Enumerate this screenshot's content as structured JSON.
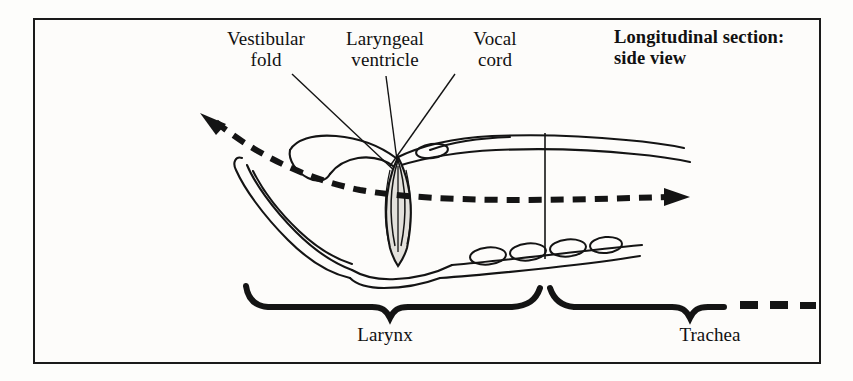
{
  "figure": {
    "title": "Longitudinal section:\nside view",
    "background_color": "#fdfcfa",
    "frame_color": "#1a1a1a",
    "ink_color": "#141414",
    "fill_color": "#e3e1dc"
  },
  "labels": {
    "vestibular_fold": "Vestibular\nfold",
    "laryngeal_ventricle": "Laryngeal\nventricle",
    "vocal_cord": "Vocal\ncord",
    "larynx": "Larynx",
    "trachea": "Trachea"
  },
  "diagram": {
    "parts": [
      "epiglottis-outline",
      "vestibular-fold-outline",
      "laryngeal-ventricle",
      "vocal-cord-lens",
      "thyroid-cartilage",
      "cricoid-cartilage",
      "tracheal-rings",
      "larynx-trachea-divider"
    ],
    "airflow_arrow": "dashed-bidirectional-airflow-arrow",
    "brace_larynx": "curly-brace-down-larynx",
    "brace_trachea": "curly-brace-down-trachea",
    "continuation_dashes": "trachea-continues-dashes"
  }
}
